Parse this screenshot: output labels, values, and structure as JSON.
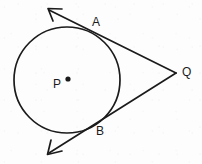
{
  "figure": {
    "type": "geometry-diagram",
    "background_color": "#fdfdfd",
    "stroke_color": "#1b1b1b",
    "stroke_width": 1.6,
    "canvas": {
      "width": 202,
      "height": 164
    },
    "circle": {
      "name": "circle-P",
      "center": {
        "x": 67,
        "y": 80
      },
      "radius": 53
    },
    "center_point": {
      "name": "point-P",
      "label": "P",
      "dot": {
        "x": 68,
        "y": 79,
        "r": 2.6
      },
      "label_position": {
        "x": 53,
        "y": 78
      }
    },
    "points": [
      {
        "name": "point-A",
        "label": "A",
        "position": {
          "x": 95,
          "y": 33
        },
        "label_position": {
          "x": 92,
          "y": 16
        },
        "role": "tangency-point"
      },
      {
        "name": "point-B",
        "label": "B",
        "position": {
          "x": 97,
          "y": 118
        },
        "label_position": {
          "x": 96,
          "y": 125
        },
        "role": "tangency-point"
      },
      {
        "name": "point-Q",
        "label": "Q",
        "position": {
          "x": 176,
          "y": 73
        },
        "label_position": {
          "x": 182,
          "y": 66
        },
        "role": "external-vertex"
      }
    ],
    "rays": [
      {
        "name": "ray-QA",
        "from": {
          "x": 176,
          "y": 73
        },
        "through": {
          "x": 95,
          "y": 33
        },
        "to": {
          "x": 48,
          "y": 9
        },
        "arrow_at": "to",
        "arrow_tip": {
          "x": 48,
          "y": 9
        }
      },
      {
        "name": "ray-QB",
        "from": {
          "x": 176,
          "y": 73
        },
        "through": {
          "x": 97,
          "y": 118
        },
        "to": {
          "x": 48,
          "y": 154
        },
        "arrow_at": "to",
        "arrow_tip": {
          "x": 48,
          "y": 154
        }
      }
    ],
    "labels": {
      "A": "A",
      "B": "B",
      "P": "P",
      "Q": "Q"
    }
  }
}
